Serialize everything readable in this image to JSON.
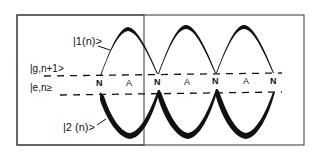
{
  "diagram": {
    "labels": {
      "state_upper": "|1(n)>",
      "state_lower": "|2 (n)>",
      "level_g": "|g,n+1>",
      "level_e": "|e,n≥"
    },
    "node_markers": [
      "N",
      "A",
      "N",
      "A",
      "N",
      "A",
      "N"
    ],
    "colors": {
      "ink": "#111111",
      "background": "#ffffff",
      "frame": "#333333"
    }
  }
}
